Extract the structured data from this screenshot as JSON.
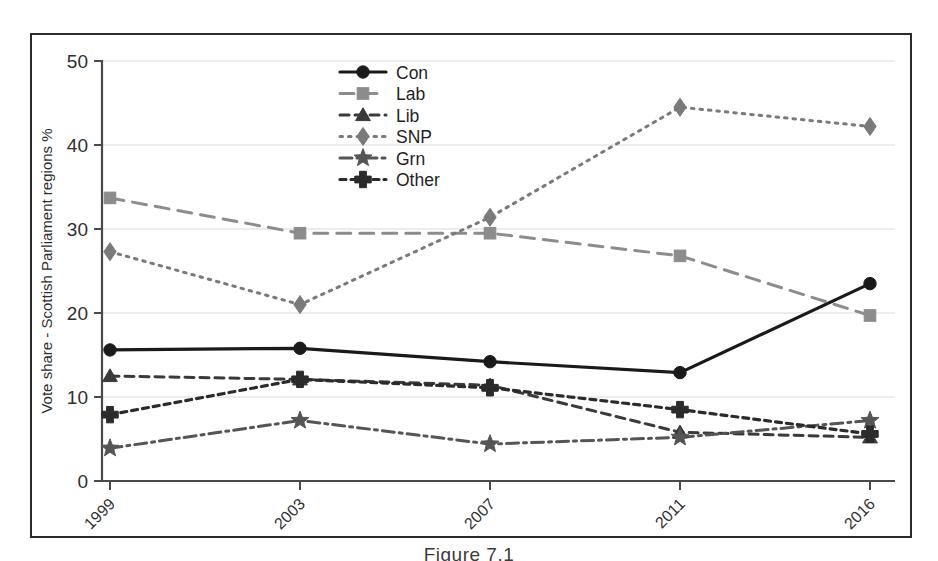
{
  "figure": {
    "caption": "Figure 7.1"
  },
  "chart_data": {
    "type": "line",
    "title": "",
    "subtitle": "",
    "xlabel": "",
    "ylabel": "Vote share - Scottish Parliament regions %",
    "categories": [
      "1999",
      "2003",
      "2007",
      "2011",
      "2016"
    ],
    "x": [
      1999,
      2003,
      2007,
      2011,
      2016
    ],
    "ylim": [
      0,
      50
    ],
    "yticks": [
      0,
      10,
      20,
      30,
      40,
      50
    ],
    "ytick_labels": [
      "0",
      "10",
      "20",
      "30",
      "40",
      "50"
    ],
    "xtick_labels": [
      "1999",
      "2003",
      "2007",
      "2011",
      "2016"
    ],
    "grid": "horizontal",
    "legend_position": "top-center-right",
    "series": [
      {
        "name": "Con",
        "values": [
          15.6,
          15.8,
          14.2,
          12.9,
          23.5
        ],
        "color": "#1a1a1a",
        "dash": "none",
        "marker": "circle"
      },
      {
        "name": "Lab",
        "values": [
          33.7,
          29.5,
          29.5,
          26.8,
          19.7
        ],
        "color": "#8c8c8c",
        "dash": "long",
        "marker": "square"
      },
      {
        "name": "Lib",
        "values": [
          12.5,
          12.1,
          11.4,
          5.8,
          5.2
        ],
        "color": "#3a3a3a",
        "dash": "medium",
        "marker": "triangle"
      },
      {
        "name": "SNP",
        "values": [
          27.3,
          21.0,
          31.4,
          44.5,
          42.2
        ],
        "color": "#7a7a7a",
        "dash": "dotted",
        "marker": "diamond"
      },
      {
        "name": "Grn",
        "values": [
          3.9,
          7.2,
          4.4,
          5.2,
          7.2
        ],
        "color": "#555555",
        "dash": "dashdot",
        "marker": "star"
      },
      {
        "name": "Other",
        "values": [
          7.9,
          12.1,
          11.1,
          8.5,
          5.6
        ],
        "color": "#2b2b2b",
        "dash": "shortdash",
        "marker": "plus"
      }
    ],
    "legend_entries": [
      "Con",
      "Lab",
      "Lib",
      "SNP",
      "Grn",
      "Other"
    ]
  },
  "axes": {
    "y_axis_label": "Vote share - Scottish Parliament regions %"
  }
}
